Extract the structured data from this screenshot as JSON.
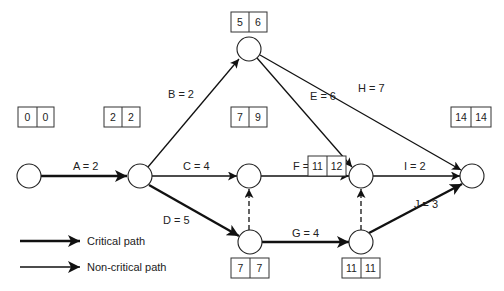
{
  "diagram": {
    "type": "activity-on-arrow network (critical path)",
    "nodes": [
      {
        "id": "n1",
        "x": 29,
        "y": 176,
        "es": "0",
        "lf": "0",
        "box_pos": "above"
      },
      {
        "id": "n2",
        "x": 140,
        "y": 176,
        "es": "2",
        "lf": "2",
        "box_pos": "above"
      },
      {
        "id": "n3",
        "x": 249,
        "y": 49,
        "es": "5",
        "lf": "6",
        "box_pos": "above"
      },
      {
        "id": "n4",
        "x": 249,
        "y": 176,
        "es": "7",
        "lf": "9",
        "box_pos": "above"
      },
      {
        "id": "n5",
        "x": 361,
        "y": 176,
        "es": "11",
        "lf": "12",
        "box_pos": "below-left"
      },
      {
        "id": "n6",
        "x": 250,
        "y": 242,
        "es": "7",
        "lf": "7",
        "box_pos": "below"
      },
      {
        "id": "n7",
        "x": 361,
        "y": 242,
        "es": "11",
        "lf": "11",
        "box_pos": "below"
      },
      {
        "id": "n8",
        "x": 472,
        "y": 176,
        "es": "14",
        "lf": "14",
        "box_pos": "above"
      }
    ],
    "activities": [
      {
        "label": "A = 2",
        "from": "n1",
        "to": "n2",
        "critical": true
      },
      {
        "label": "B = 2",
        "from": "n2",
        "to": "n3",
        "critical": false
      },
      {
        "label": "C = 4",
        "from": "n2",
        "to": "n4",
        "critical": false
      },
      {
        "label": "D = 5",
        "from": "n2",
        "to": "n6",
        "critical": true
      },
      {
        "label": "E = 6",
        "from": "n3",
        "to": "n5",
        "critical": false
      },
      {
        "label": "H = 7",
        "from": "n3",
        "to": "n8",
        "critical": false
      },
      {
        "label": "F = 3",
        "from": "n4",
        "to": "n5",
        "critical": false
      },
      {
        "label": "I = 2",
        "from": "n5",
        "to": "n8",
        "critical": false
      },
      {
        "label": "G = 4",
        "from": "n6",
        "to": "n7",
        "critical": true
      },
      {
        "label": "J = 3",
        "from": "n7",
        "to": "n8",
        "critical": true
      }
    ],
    "dummies": [
      {
        "from": "n6",
        "to": "n4"
      },
      {
        "from": "n7",
        "to": "n5"
      }
    ]
  },
  "legend": {
    "critical_label": "Critical path",
    "noncritical_label": "Non-critical path"
  }
}
